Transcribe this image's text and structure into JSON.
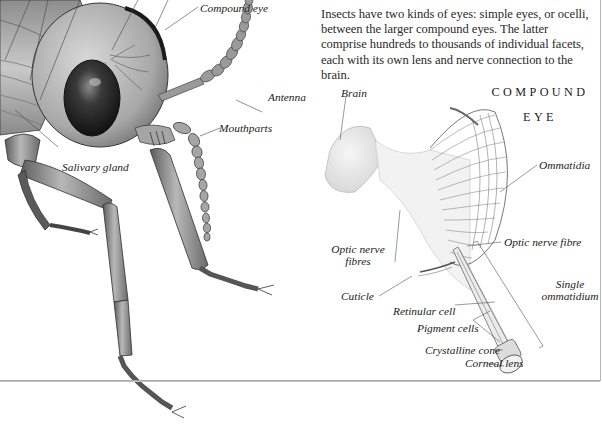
{
  "intro": {
    "paragraph": "Insects have two kinds of eyes: simple eyes, or ocelli, between the larger compound eyes. The latter comprise hundreds to thousands of individual facets, each with its own lens and nerve connection to the brain."
  },
  "insect_head_diagram": {
    "labels": {
      "compound_eye": "Compound eye",
      "antenna": "Antenna",
      "mouthparts": "Mouthparts",
      "salivary_gland": "Salivary gland"
    }
  },
  "compound_eye_diagram": {
    "title_line1": "COMPOUND",
    "title_line2": "EYE",
    "labels": {
      "brain": "Brain",
      "ommatidia": "Ommatidia",
      "optic_nerve_fibres_line1": "Optic nerve",
      "optic_nerve_fibres_line2": "fibres",
      "optic_nerve_fibre": "Optic nerve fibre",
      "single_ommatidium_line1": "Single",
      "single_ommatidium_line2": "ommatidium",
      "cuticle": "Cuticle",
      "retinular_cell": "Retinular cell",
      "pigment_cells": "Pigment cells",
      "crystalline_cone": "Crystalline cone",
      "corneal_lens": "Corneal lens"
    }
  }
}
